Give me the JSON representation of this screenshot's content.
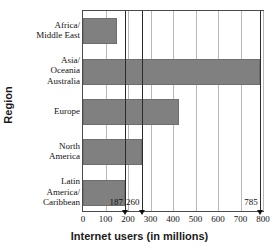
{
  "chart_data": {
    "type": "bar",
    "orientation": "horizontal",
    "title": "",
    "xlabel": "Internet users (in millions)",
    "ylabel": "Region",
    "categories": [
      "Africa/\nMiddle East",
      "Asia/\nOceania\nAustralia",
      "Europe",
      "North\nAmerica",
      "Latin\nAmerica/\nCaribbean"
    ],
    "values": [
      150,
      785,
      425,
      260,
      187
    ],
    "xlim": [
      0,
      800
    ],
    "xticks": [
      0,
      100,
      200,
      300,
      400,
      500,
      600,
      700,
      800
    ],
    "xtick_labels": [
      "0",
      "100",
      "200",
      "300",
      "400",
      "500",
      "600",
      "700",
      "800"
    ],
    "grid": true,
    "legend": false,
    "bar_color": "#808080",
    "annotations": [
      {
        "label": "187",
        "value": 187
      },
      {
        "label": "260",
        "value": 260
      },
      {
        "label": "785",
        "value": 785
      }
    ]
  },
  "axes": {
    "y_title": "Region",
    "x_title": "Internet users (in millions)"
  },
  "categories": [
    {
      "lines": [
        "Africa/",
        "Middle East"
      ]
    },
    {
      "lines": [
        "Asia/",
        "Oceania",
        "Australia"
      ]
    },
    {
      "lines": [
        "Europe"
      ]
    },
    {
      "lines": [
        "North",
        "America"
      ]
    },
    {
      "lines": [
        "Latin",
        "America/",
        "Caribbean"
      ]
    }
  ]
}
